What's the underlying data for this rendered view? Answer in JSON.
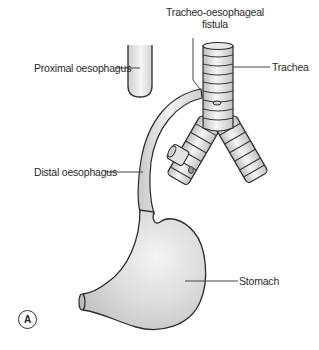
{
  "figure": {
    "panel_letter": "A",
    "labels": {
      "fistula_line1": "Tracheo-oesophageal",
      "fistula_line2": "fistula",
      "proximal_oesophagus": "Proximal oesophagus",
      "trachea": "Trachea",
      "distal_oesophagus": "Distal oesophagus",
      "stomach": "Stomach"
    },
    "colors": {
      "outline": "#2b2b2b",
      "fill_light": "#f2f2f2",
      "fill_mid": "#d6d6d6",
      "fill_dark": "#b8b8b8",
      "leader_line": "#444444"
    }
  }
}
